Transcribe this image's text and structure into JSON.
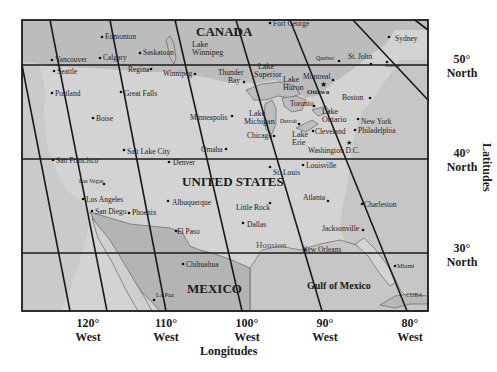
{
  "map": {
    "countries": {
      "canada": "CANADA",
      "united_states": "UNITED STATES",
      "mexico": "MEXICO"
    },
    "water": {
      "gulf_of_mexico": "Gulf of Mexico",
      "lake_winnipeg": [
        "Lake",
        "Winnipeg"
      ],
      "lake_superior": [
        "Lake",
        "Superior"
      ],
      "lake_huron": [
        "Lake",
        "Huron"
      ],
      "lake_michigan": [
        "Lake",
        "Michigan"
      ],
      "lake_erie": [
        "Lake",
        "Erie"
      ],
      "lake_ontario": [
        "Lake",
        "Ontario"
      ]
    },
    "other_labels": {
      "cuba": "CUBA",
      "houston": "Houston"
    },
    "cities": [
      {
        "name": "Fort George",
        "x": 270,
        "y": 23
      },
      {
        "name": "Edmonton",
        "x": 102,
        "y": 37
      },
      {
        "name": "Saskatoon",
        "x": 140,
        "y": 53
      },
      {
        "name": "Calgary",
        "x": 100,
        "y": 58
      },
      {
        "name": "Vancouver",
        "x": 52,
        "y": 60
      },
      {
        "name": "Seattle",
        "x": 54,
        "y": 71
      },
      {
        "name": "Regina",
        "x": 150,
        "y": 70
      },
      {
        "name": "Winnipeg",
        "x": 195,
        "y": 74
      },
      {
        "name": "Thunder Bay",
        "x": 244,
        "y": 82
      },
      {
        "name": "Quebec",
        "x": 339,
        "y": 61
      },
      {
        "name": "St. John",
        "x": 371,
        "y": 64
      },
      {
        "name": "Halifax",
        "x": 387,
        "y": 66
      },
      {
        "name": "Sydney",
        "x": 395,
        "y": 38
      },
      {
        "name": "Montreal",
        "x": 333,
        "y": 80
      },
      {
        "name": "Ottawa",
        "x": 323,
        "y": 88
      },
      {
        "name": "Boston",
        "x": 369,
        "y": 98
      },
      {
        "name": "Portland",
        "x": 52,
        "y": 93
      },
      {
        "name": "Great Falls",
        "x": 120,
        "y": 93
      },
      {
        "name": "Boise",
        "x": 93,
        "y": 118
      },
      {
        "name": "Minneapolis",
        "x": 232,
        "y": 116
      },
      {
        "name": "Toronto",
        "x": 314,
        "y": 105
      },
      {
        "name": "Detroit",
        "x": 293,
        "y": 125
      },
      {
        "name": "Cleveland",
        "x": 314,
        "y": 131
      },
      {
        "name": "Chicago",
        "x": 273,
        "y": 136
      },
      {
        "name": "New York",
        "x": 358,
        "y": 119
      },
      {
        "name": "Philadelphia",
        "x": 354,
        "y": 130
      },
      {
        "name": "Washington D.C.",
        "x": 349,
        "y": 142
      },
      {
        "name": "Salt Lake City",
        "x": 124,
        "y": 150
      },
      {
        "name": "Omaha",
        "x": 226,
        "y": 150
      },
      {
        "name": "San Francisco",
        "x": 52,
        "y": 160
      },
      {
        "name": "Denver",
        "x": 169,
        "y": 161
      },
      {
        "name": "St. Louis",
        "x": 270,
        "y": 167
      },
      {
        "name": "Louisville",
        "x": 303,
        "y": 165
      },
      {
        "name": "Las Vegas",
        "x": 105,
        "y": 184
      },
      {
        "name": "Atlanta",
        "x": 327,
        "y": 201
      },
      {
        "name": "Charleston",
        "x": 361,
        "y": 205
      },
      {
        "name": "Los Angeles",
        "x": 83,
        "y": 199
      },
      {
        "name": "Little Rock",
        "x": 269,
        "y": 203
      },
      {
        "name": "Albuquerque",
        "x": 168,
        "y": 201
      },
      {
        "name": "San Diego",
        "x": 91,
        "y": 211
      },
      {
        "name": "Phoenix",
        "x": 128,
        "y": 212
      },
      {
        "name": "Dallas",
        "x": 243,
        "y": 223
      },
      {
        "name": "Jacksonville",
        "x": 362,
        "y": 229
      },
      {
        "name": "El Paso",
        "x": 176,
        "y": 231
      },
      {
        "name": "New Orleans",
        "x": 305,
        "y": 249
      },
      {
        "name": "Miami",
        "x": 395,
        "y": 265
      },
      {
        "name": "Chihuahua",
        "x": 183,
        "y": 264
      },
      {
        "name": "La Paz",
        "x": 154,
        "y": 300
      }
    ],
    "latitudes": [
      {
        "deg": "50°",
        "dir": "North",
        "y": 65
      },
      {
        "deg": "40°",
        "dir": "North",
        "y": 159
      },
      {
        "deg": "30°",
        "dir": "North",
        "y": 253
      }
    ],
    "longitudes": [
      {
        "deg": "120°",
        "dir": "West",
        "x": 107
      },
      {
        "deg": "110°",
        "dir": "West",
        "x": 166
      },
      {
        "deg": "100°",
        "dir": "West",
        "x": 242
      },
      {
        "deg": "90°",
        "dir": "West",
        "x": 322
      },
      {
        "deg": "80°",
        "dir": "West",
        "x": 407
      }
    ],
    "axis_titles": {
      "latitudes": "Latitudes",
      "longitudes": "Longitudes"
    },
    "colors": {
      "land_us": "#d4d4d4",
      "land_canada_mexico": "#b8b8b8",
      "water": "#c8c8c8",
      "lines": "#1a1a1a",
      "background": "#ffffff"
    }
  }
}
